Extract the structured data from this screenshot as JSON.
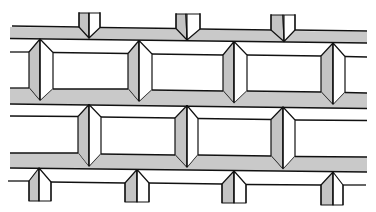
{
  "figure": {
    "description": "Line illustration of a brick/paving bond pattern with beveled (chamfered) joints and shaded horizontal mortar bands",
    "colors": {
      "background": "#ffffff",
      "line": "#111111",
      "shading": "#c9c9c9"
    },
    "bands": [
      {
        "name": "top-band",
        "y_top_left": 26,
        "y_top_right": 31,
        "thickness": 11
      },
      {
        "name": "middle-band",
        "y_top_left": 92,
        "y_top_right": 97,
        "thickness": 11
      },
      {
        "name": "lower-band",
        "y_top_left": 155,
        "y_top_right": 160,
        "thickness": 12
      }
    ],
    "rows": [
      {
        "name": "top-posts",
        "joints_x": [
          89,
          186,
          283
        ]
      },
      {
        "name": "brick-row-1",
        "joints_x": [
          40,
          138,
          233,
          332
        ]
      },
      {
        "name": "brick-row-2",
        "joints_x": [
          89,
          186,
          283
        ]
      },
      {
        "name": "bottom-posts",
        "joints_x": [
          39,
          137,
          234,
          333
        ]
      }
    ]
  }
}
